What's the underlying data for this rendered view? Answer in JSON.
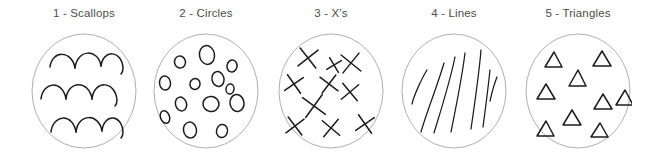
{
  "figure": {
    "background_color": "#ffffff",
    "outline_color": "#9a9a9a",
    "mark_color": "#1c1c1c",
    "label_color": "#4d4d4d"
  },
  "panels": [
    {
      "id": "scallops",
      "label": "1 - Scallops",
      "pattern_name": "scallops",
      "mark_count": 9,
      "description": "three horizontal rows of hand-drawn scallop arcs inside an outlined circle"
    },
    {
      "id": "circles",
      "label": "2 - Circles",
      "pattern_name": "circles",
      "mark_count": 13,
      "description": "thirteen small hand-drawn ovals scattered inside an outlined circle"
    },
    {
      "id": "xs",
      "label": "3 - X’s",
      "pattern_name": "x-marks",
      "mark_count": 10,
      "description": "ten hand-drawn X marks scattered inside an outlined circle"
    },
    {
      "id": "lines",
      "label": "4 - Lines",
      "pattern_name": "lines",
      "mark_count": 7,
      "description": "seven hand-drawn diagonal lines slanting up to the right inside an outlined circle"
    },
    {
      "id": "triangles",
      "label": "5 - Triangles",
      "pattern_name": "triangles",
      "mark_count": 10,
      "description": "ten small hand-drawn triangles scattered inside an outlined circle"
    }
  ]
}
